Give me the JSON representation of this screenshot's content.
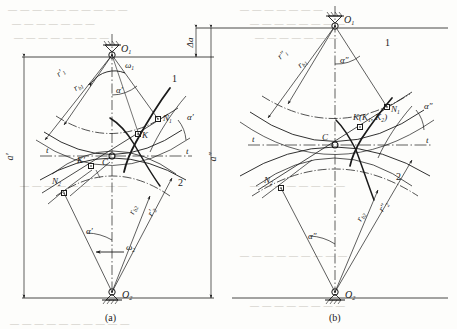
{
  "figure": {
    "panels": [
      {
        "id": "a",
        "caption": "(a)",
        "centers": {
          "top": "O",
          "top_sub": "1",
          "bottom": "O",
          "bottom_sub": "2"
        },
        "labels": {
          "omega1": "ω",
          "omega1_sub": "1",
          "omega2": "ω",
          "omega2_sub": "2",
          "alpha_top": "α′",
          "alpha_right": "α′",
          "alpha_bottom": "α′",
          "r1": "r′",
          "r1_sub": "1",
          "rb1": "r",
          "rb1_sub": "b1",
          "r2": "r′",
          "r2_sub": "2",
          "rb2": "r",
          "rb2_sub": "b2",
          "N1": "N",
          "N1_sub": "1",
          "N2": "N",
          "N2_sub": "2",
          "K": "K",
          "Kprime": "K′",
          "C": "C",
          "t_left": "t",
          "t_right": "t",
          "curve1": "1",
          "curve2": "2"
        },
        "dimensions": {
          "left": "a′",
          "right": "a″",
          "delta": "Δa"
        }
      },
      {
        "id": "b",
        "caption": "(b)",
        "centers": {
          "top": "O",
          "top_sub": "1",
          "bottom": "O",
          "bottom_sub": "2"
        },
        "labels": {
          "alpha_top": "α″",
          "alpha_right": "α″",
          "alpha_bottom": "α″",
          "r1": "r″",
          "r1_sub": "1",
          "rb1": "r",
          "rb1_sub": "b1",
          "r2": "r″",
          "r2_sub": "2",
          "rb2": "r",
          "rb2_sub": "b2",
          "N1": "N",
          "N1_sub": "1",
          "N2": "N",
          "N2_sub": "2",
          "K": "K(K",
          "K_sub1": "1",
          "K_mid": ", K",
          "K_sub2": "2",
          "K_end": ")",
          "C": "C",
          "t_left": "t",
          "t_right": "t",
          "curve1": "1",
          "curve2": "2"
        }
      }
    ],
    "colors": {
      "ink": "#1a1a1a",
      "thin": "#3a3a3a",
      "bg": "#fdfdfb",
      "ghost": "#c9c6c0"
    }
  },
  "bleed_text": {
    "top_line_1": "— — — — — — — — — —",
    "top_line_2": "— — — — — — —",
    "mid_line": "— — — — — — — —",
    "bottom_line": "— — — — — — — — —"
  }
}
